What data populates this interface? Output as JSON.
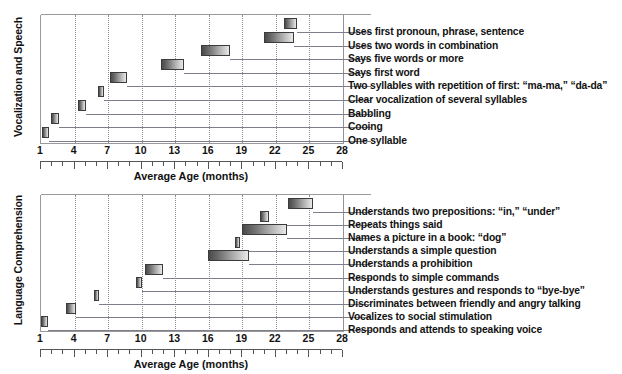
{
  "figure": {
    "ghost_caption": "",
    "bar_color_dark": "#4a4a4a",
    "bar_color_light": "#e8e8e8",
    "bar_border": "#3b3b3b",
    "gridline_color": "#8c8c9c",
    "axis_color": "#555555"
  },
  "chart_data": [
    {
      "type": "bar",
      "orientation": "horizontal-range",
      "title": "Vocalization and Speech",
      "ylabel": "Vocalization and Speech",
      "xlabel": "Average Age (months)",
      "xlim": [
        1,
        28
      ],
      "xticks": [
        1,
        4,
        7,
        10,
        13,
        16,
        19,
        22,
        25,
        28
      ],
      "xtick_labels": [
        "1",
        "4",
        "7",
        "10",
        "13",
        "16",
        "19",
        "22",
        "25",
        "28"
      ],
      "grid": true,
      "legend": "none",
      "categories": [
        "Uses first pronoun, phrase, sentence",
        "Uses two words in combination",
        "Says five words or more",
        "Says first word",
        "Two syllables with repetition of first: “ma-ma,” “da-da”",
        "Clear vocalization of several syllables",
        "Babbling",
        "Cooing",
        "One syllable"
      ],
      "ranges": [
        {
          "label": "Uses first pronoun, phrase, sentence",
          "start": 22.7,
          "end": 23.9
        },
        {
          "label": "Uses two words in combination",
          "start": 20.9,
          "end": 23.6
        },
        {
          "label": "Says five words or more",
          "start": 15.3,
          "end": 17.9
        },
        {
          "label": "Says first word",
          "start": 11.7,
          "end": 13.8
        },
        {
          "label": "Two syllables with repetition of first: “ma-ma,” “da-da”",
          "start": 7.2,
          "end": 8.7
        },
        {
          "label": "Clear vocalization of several syllables",
          "start": 6.1,
          "end": 6.6
        },
        {
          "label": "Babbling",
          "start": 4.3,
          "end": 5.0
        },
        {
          "label": "Cooing",
          "start": 1.9,
          "end": 2.6
        },
        {
          "label": "One syllable",
          "start": 1.1,
          "end": 1.7
        }
      ]
    },
    {
      "type": "bar",
      "orientation": "horizontal-range",
      "title": "Language Comprehension",
      "ylabel": "Language Comprehension",
      "xlabel": "Average Age (months)",
      "xlim": [
        1,
        28
      ],
      "xticks": [
        1,
        4,
        7,
        10,
        13,
        16,
        19,
        22,
        25,
        28
      ],
      "xtick_labels": [
        "1",
        "4",
        "7",
        "10",
        "13",
        "16",
        "19",
        "22",
        "25",
        "28"
      ],
      "grid": true,
      "legend": "none",
      "categories": [
        "Understands two prepositions: “in,” “under”",
        "Repeats things said",
        "Names a picture in a book: “dog”",
        "Understands a simple question",
        "Understands a prohibition",
        "Responds to simple commands",
        "Understands gestures and responds to “bye-bye”",
        "Discriminates between friendly and angry talking",
        "Vocalizes to social stimulation",
        "Responds and attends to speaking voice"
      ],
      "ranges": [
        {
          "label": "Understands two prepositions: “in,” “under”",
          "start": 23.1,
          "end": 25.3
        },
        {
          "label": "Repeats things said",
          "start": 20.6,
          "end": 21.4
        },
        {
          "label": "Names a picture in a book: “dog”",
          "start": 19.0,
          "end": 23.0
        },
        {
          "label": "Understands a simple question",
          "start": 18.3,
          "end": 18.8
        },
        {
          "label": "Understands a prohibition",
          "start": 15.9,
          "end": 19.6
        },
        {
          "label": "Responds to simple commands",
          "start": 10.3,
          "end": 11.9
        },
        {
          "label": "Understands gestures and responds to “bye-bye”",
          "start": 9.5,
          "end": 10.0
        },
        {
          "label": "Discriminates between friendly and angry talking",
          "start": 5.7,
          "end": 6.2
        },
        {
          "label": "Vocalizes to social stimulation",
          "start": 3.2,
          "end": 4.1
        },
        {
          "label": "Responds and attends to speaking voice",
          "start": 1.0,
          "end": 1.6
        }
      ]
    }
  ]
}
